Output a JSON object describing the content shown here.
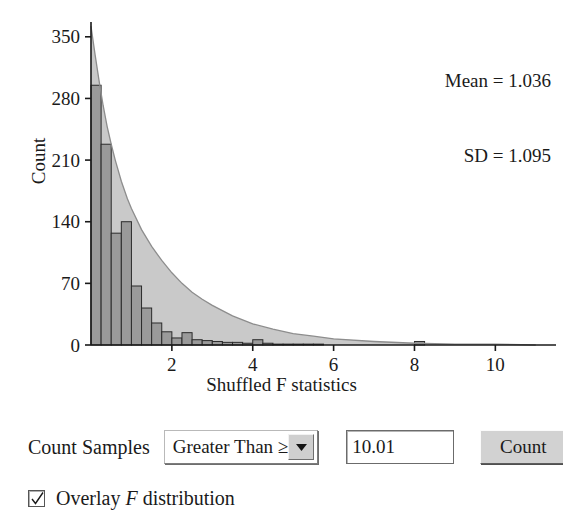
{
  "annotation": {
    "mean_text": "Mean = 1.036",
    "sd_text": "SD = 1.095"
  },
  "controls": {
    "count_samples_label": "Count Samples",
    "comparison_value": "Greater Than ≥",
    "comparison_options": [
      "Greater Than ≥",
      "Less Than ≤",
      "Between"
    ],
    "dropdown_arrow_icon": "chevron-down-icon",
    "threshold_value": "10.01",
    "threshold_placeholder": "",
    "count_button_label": "Count",
    "overlay_checkbox_checked": true,
    "overlay_checkbox_icon": "check-icon",
    "overlay_label_prefix": "Overlay ",
    "overlay_label_italic": "F",
    "overlay_label_suffix": " distribution"
  },
  "chart_data": {
    "type": "bar",
    "title": "",
    "subtitle": "",
    "xlabel": "Shuffled F statistics",
    "ylabel": "Count",
    "xlim": [
      0,
      11.5
    ],
    "ylim": [
      0,
      360
    ],
    "xticks": [
      2,
      4,
      6,
      8,
      10
    ],
    "yticks": [
      0,
      70,
      140,
      210,
      280,
      350
    ],
    "grid": false,
    "legend": false,
    "bin_width": 0.25,
    "bar_color": "#9a9a9a",
    "bar_edge_color": "#2b2b2b",
    "overlay_fill_color": "#c9c9c9",
    "overlay_line_color": "#8d8d8d",
    "bin_starts": [
      0.0,
      0.25,
      0.5,
      0.75,
      1.0,
      1.25,
      1.5,
      1.75,
      2.0,
      2.25,
      2.5,
      2.75,
      3.0,
      3.25,
      3.5,
      3.75,
      4.0,
      4.25,
      4.5,
      4.75,
      5.0,
      5.25,
      5.5,
      5.75,
      6.0,
      6.25,
      6.5,
      6.75,
      7.0,
      7.25,
      7.5,
      7.75,
      8.0,
      8.25,
      8.5,
      8.75,
      9.0,
      9.25,
      9.5,
      9.75,
      10.0,
      10.25,
      10.5,
      10.75,
      11.0
    ],
    "values": [
      295,
      228,
      127,
      140,
      67,
      42,
      25,
      15,
      8,
      14,
      6,
      5,
      4,
      3,
      3,
      2,
      6,
      2,
      1,
      1,
      1,
      1,
      1,
      0,
      0,
      0,
      0,
      0,
      0,
      0,
      0,
      0,
      4,
      0,
      0,
      0,
      0,
      0,
      0,
      0,
      0,
      0,
      0,
      0,
      0
    ],
    "overlay_curve": {
      "name": "F distribution",
      "x": [
        0.0,
        0.1,
        0.2,
        0.3,
        0.4,
        0.5,
        0.6,
        0.75,
        0.9,
        1.0,
        1.25,
        1.5,
        1.75,
        2.0,
        2.25,
        2.5,
        2.75,
        3.0,
        3.5,
        4.0,
        4.5,
        5.0,
        5.5,
        6.0,
        7.0,
        8.0,
        9.0,
        10.0,
        11.0
      ],
      "y": [
        362,
        330,
        300,
        272,
        248,
        228,
        210,
        186,
        166,
        155,
        131,
        112,
        96,
        82,
        70,
        60,
        52,
        45,
        33,
        24,
        18,
        13,
        10,
        7,
        4,
        2,
        1,
        1,
        0
      ]
    }
  }
}
